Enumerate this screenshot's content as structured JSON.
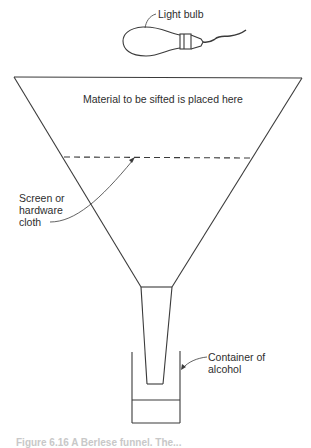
{
  "diagram": {
    "type": "apparatus-illustration",
    "labels": {
      "light_bulb": "Light bulb",
      "material": "Material to be sifted is placed here",
      "screen_line1": "Screen or",
      "screen_line2": "hardware",
      "screen_line3": "cloth",
      "container_line1": "Container of",
      "container_line2": "alcohol"
    },
    "caption": "Figure 6.16  A Berlese funnel. The...",
    "colors": {
      "stroke": "#3a3a3a",
      "background": "#ffffff"
    }
  }
}
